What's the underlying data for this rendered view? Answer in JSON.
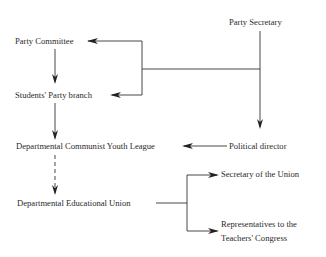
{
  "diagram": {
    "nodes": {
      "party_secretary": "Party Secretary",
      "party_committee": "Party Committee",
      "students_party_branch": "Students' Party branch",
      "political_director": "Political director",
      "dept_communist_youth_league": "Departmental Communist Youth League",
      "dept_educational_union": "Departmental Educational Union",
      "secretary_of_union": "Secretary of the Union",
      "representatives_line1": "Representatives to the",
      "representatives_line2": "Teachers' Congress"
    },
    "edges": [
      {
        "from": "Party Secretary",
        "to": "Party Committee",
        "style": "solid"
      },
      {
        "from": "Party Secretary",
        "to": "Students' Party branch",
        "style": "solid"
      },
      {
        "from": "Party Secretary",
        "to": "Political director",
        "style": "solid"
      },
      {
        "from": "Party Committee",
        "to": "Students' Party branch",
        "style": "solid"
      },
      {
        "from": "Students' Party branch",
        "to": "Departmental Communist Youth League",
        "style": "solid"
      },
      {
        "from": "Political director",
        "to": "Departmental Communist Youth League",
        "style": "solid"
      },
      {
        "from": "Departmental Communist Youth League",
        "to": "Departmental Educational Union",
        "style": "dashed"
      },
      {
        "from": "Departmental Educational Union",
        "to": "Secretary of the Union",
        "style": "solid"
      },
      {
        "from": "Departmental Educational Union",
        "to": "Representatives to the Teachers' Congress",
        "style": "solid"
      }
    ]
  }
}
